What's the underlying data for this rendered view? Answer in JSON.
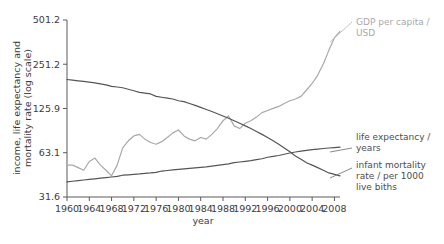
{
  "chart_data": {
    "type": "line",
    "title": "",
    "xlabel": "year",
    "ylabel": "income, life expectancy and mortality rate (log scale)",
    "yscale": "log",
    "ylim": [
      31.6,
      501.2
    ],
    "xlim": [
      1960,
      2009
    ],
    "grid": false,
    "legend_position": "right-inline-annotations",
    "ytick_labels": [
      "501.2",
      "251.2",
      "125.9",
      "63.1",
      "31.6"
    ],
    "ytick_values": [
      501.2,
      251.2,
      125.9,
      63.1,
      31.6
    ],
    "xtick_labels": [
      "1960",
      "1964",
      "1968",
      "1972",
      "1976",
      "1980",
      "1984",
      "1988",
      "1992",
      "1996",
      "2000",
      "2004",
      "2008"
    ],
    "xtick_values": [
      1960,
      1964,
      1968,
      1972,
      1976,
      1980,
      1984,
      1988,
      1992,
      1996,
      2000,
      2004,
      2008
    ],
    "x": [
      1960,
      1961,
      1962,
      1963,
      1964,
      1965,
      1966,
      1967,
      1968,
      1969,
      1970,
      1971,
      1972,
      1973,
      1974,
      1975,
      1976,
      1977,
      1978,
      1979,
      1980,
      1981,
      1982,
      1983,
      1984,
      1985,
      1986,
      1987,
      1988,
      1989,
      1990,
      1991,
      1992,
      1993,
      1994,
      1995,
      1996,
      1997,
      1998,
      1999,
      2000,
      2001,
      2002,
      2003,
      2004,
      2005,
      2006,
      2007,
      2008,
      2009
    ],
    "series": [
      {
        "name": "GDP per capita / USD",
        "label": "GDP per capita / USD",
        "color": "#a8a8a8",
        "values": [
          52,
          52,
          50,
          48,
          55,
          58,
          52,
          48,
          44,
          52,
          68,
          76,
          82,
          84,
          78,
          74,
          72,
          75,
          80,
          86,
          90,
          82,
          78,
          76,
          80,
          78,
          84,
          92,
          104,
          112,
          96,
          92,
          100,
          104,
          110,
          118,
          122,
          126,
          130,
          136,
          142,
          146,
          152,
          168,
          186,
          212,
          252,
          312,
          380,
          420
        ]
      },
      {
        "name": "infant mortality rate / per 1000 live biths",
        "label": "infant mortality rate / per 1000 live biths",
        "color": "#555555",
        "values": [
          198,
          196,
          194,
          192,
          190,
          188,
          185,
          182,
          178,
          176,
          174,
          170,
          166,
          162,
          160,
          158,
          152,
          150,
          148,
          146,
          142,
          140,
          136,
          132,
          128,
          124,
          120,
          116,
          112,
          108,
          104,
          100,
          96,
          92,
          88,
          84,
          80,
          76,
          72,
          68,
          64,
          60,
          57,
          54,
          52,
          50,
          48,
          46,
          45,
          44
        ]
      },
      {
        "name": "life expectancy / years",
        "label": "life expectancy / years",
        "color": "#555555",
        "values": [
          40.0,
          40.4,
          40.8,
          41.2,
          41.6,
          42.0,
          42.4,
          42.8,
          43.2,
          43.6,
          44.4,
          44.7,
          45.0,
          45.3,
          45.7,
          46.0,
          46.4,
          47.4,
          47.8,
          48.2,
          48.6,
          49.0,
          49.4,
          49.8,
          50.2,
          50.6,
          51.2,
          51.8,
          52.4,
          53.0,
          54.0,
          54.6,
          55.2,
          55.8,
          56.6,
          57.4,
          58.8,
          59.6,
          60.4,
          61.6,
          62.8,
          63.8,
          64.6,
          65.4,
          66.2,
          66.8,
          67.4,
          67.9,
          68.4,
          68.8
        ]
      }
    ],
    "annotations": [
      {
        "text_line1": "GDP per capita /",
        "text_line2": "USD",
        "color": "#a8a8a8"
      },
      {
        "text_line1": "life expectancy /",
        "text_line2": "years",
        "color": "#4d4d4d"
      },
      {
        "text_line1": "infant mortality",
        "text_line2": "rate / per 1000",
        "text_line3": "live biths",
        "color": "#4d4d4d"
      }
    ]
  }
}
